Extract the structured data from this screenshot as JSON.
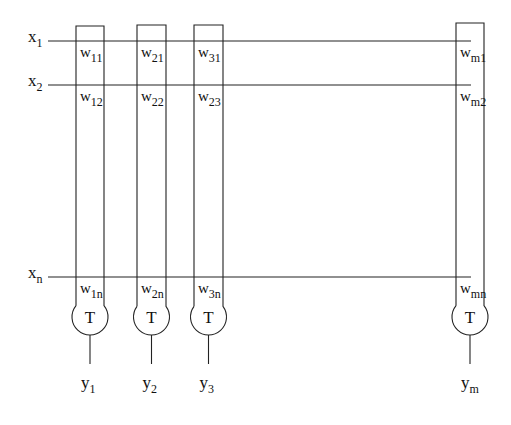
{
  "diagram": {
    "type": "single-layer neural network (crossbar of weights with threshold units)",
    "inputs": [
      {
        "label": "x",
        "sub": "1",
        "y": 41
      },
      {
        "label": "x",
        "sub": "2",
        "y": 85
      },
      {
        "label": "x",
        "sub": "n",
        "y": 277
      }
    ],
    "columns": [
      {
        "id": "1",
        "left": 76,
        "right": 104,
        "top": 26,
        "weights": [
          {
            "w": "w",
            "sub": "11"
          },
          {
            "w": "w",
            "sub": "12"
          },
          {
            "w": "w",
            "sub": "1n"
          }
        ],
        "unit": "T",
        "output": {
          "label": "y",
          "sub": "1"
        }
      },
      {
        "id": "2",
        "left": 137,
        "right": 166,
        "top": 25,
        "weights": [
          {
            "w": "w",
            "sub": "21"
          },
          {
            "w": "w",
            "sub": "22"
          },
          {
            "w": "w",
            "sub": "2n"
          }
        ],
        "unit": "T",
        "output": {
          "label": "y",
          "sub": "2"
        }
      },
      {
        "id": "3",
        "left": 194,
        "right": 223,
        "top": 25,
        "weights": [
          {
            "w": "w",
            "sub": "31"
          },
          {
            "w": "w",
            "sub": "23"
          },
          {
            "w": "w",
            "sub": "3n"
          }
        ],
        "unit": "T",
        "output": {
          "label": "y",
          "sub": "3"
        }
      },
      {
        "id": "m",
        "left": 456,
        "right": 484,
        "top": 23,
        "weights": [
          {
            "w": "w",
            "sub": "m1"
          },
          {
            "w": "w",
            "sub": "m2"
          },
          {
            "w": "w",
            "sub": "mn"
          }
        ],
        "unit": "T",
        "output": {
          "label": "y",
          "sub": "m"
        }
      }
    ],
    "line_start_x": 48,
    "line_end_x": 471,
    "unit_center_y": 317,
    "unit_radius": 18,
    "output_line_end_y": 364,
    "output_label_y": 388
  }
}
